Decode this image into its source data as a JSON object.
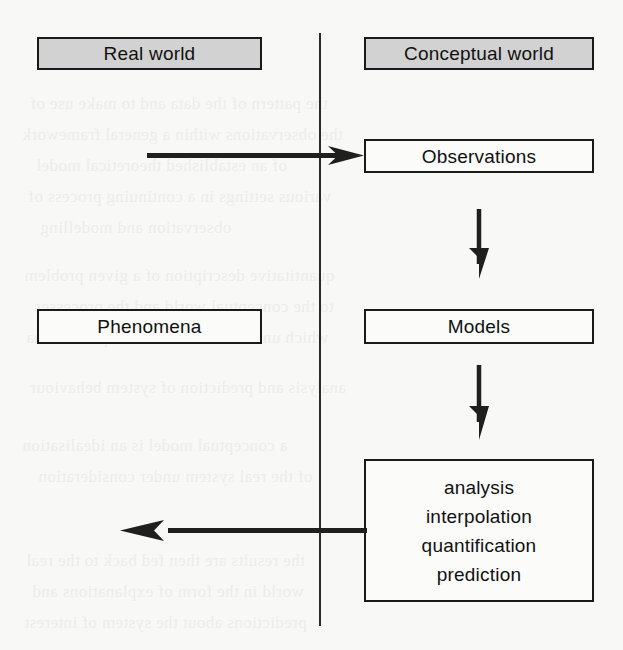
{
  "diagram": {
    "type": "flow",
    "colors": {
      "page_background": "#f8f8f6",
      "header_fill": "#d2d2d2",
      "box_fill": "#fbfbf9",
      "stroke": "#1a1a1a",
      "text": "#111111"
    },
    "columns": [
      {
        "id": "left",
        "header": "Real world"
      },
      {
        "id": "right",
        "header": "Conceptual world"
      }
    ],
    "nodes": [
      {
        "id": "real-world",
        "label": "Real world",
        "column": "left",
        "style": "header",
        "x": 37,
        "y": 37,
        "w": 225,
        "h": 33
      },
      {
        "id": "conceptual-world",
        "label": "Conceptual world",
        "column": "right",
        "style": "header",
        "x": 364,
        "y": 37,
        "w": 230,
        "h": 33
      },
      {
        "id": "observations",
        "label": "Observations",
        "column": "right",
        "style": "plain",
        "x": 364,
        "y": 139,
        "w": 230,
        "h": 34
      },
      {
        "id": "phenomena",
        "label": "Phenomena",
        "column": "left",
        "style": "plain",
        "x": 37,
        "y": 309,
        "w": 225,
        "h": 35
      },
      {
        "id": "models",
        "label": "Models",
        "column": "right",
        "style": "plain",
        "x": 364,
        "y": 309,
        "w": 230,
        "h": 35
      },
      {
        "id": "operations",
        "label": "analysis interpolation quantification prediction",
        "column": "right",
        "style": "plain-multiline",
        "x": 364,
        "y": 459,
        "w": 230,
        "h": 143,
        "lines": [
          "analysis",
          "interpolation",
          "quantification",
          "prediction"
        ]
      }
    ],
    "edges": [
      {
        "id": "phenomena-to-observations",
        "from": "real world",
        "to": "observations",
        "direction": "right",
        "label": ""
      },
      {
        "id": "observations-to-models",
        "from": "observations",
        "to": "models",
        "direction": "down",
        "label": ""
      },
      {
        "id": "models-to-operations",
        "from": "models",
        "to": "operations",
        "direction": "down",
        "label": ""
      },
      {
        "id": "operations-to-phenomena",
        "from": "operations",
        "to": "real world",
        "direction": "left",
        "label": ""
      }
    ],
    "divider": {
      "id": "world-divider",
      "x": 319,
      "y_top": 33,
      "y_bottom": 626
    }
  },
  "ghost_text": {
    "note": "faint bleed-through from reverse page, illegible",
    "lines": [
      "the pattern of the data and to make use of",
      "the observations within a general framework",
      "of an established theoretical model",
      "various settings in a continuing process of",
      "observation and modelling",
      "quantitative description of a given problem",
      "to the conceptual world and the processes",
      "which underlie the observable phenomena",
      "analysis and prediction of system behaviour",
      "a conceptual model is an idealisation",
      "of the real system under consideration",
      "the results are then fed back to the real",
      "world in the form of explanations and",
      "predictions about the system of interest"
    ]
  }
}
